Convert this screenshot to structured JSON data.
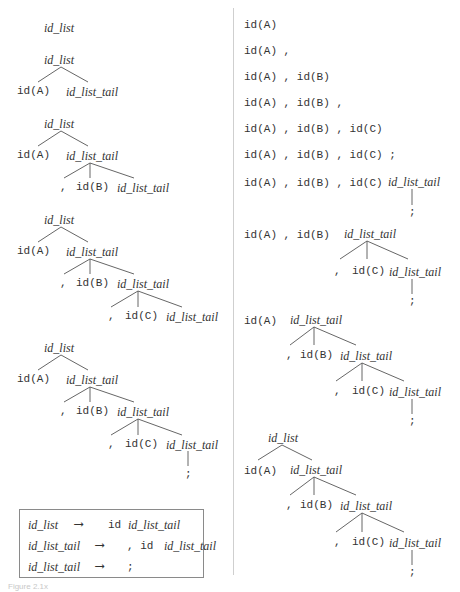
{
  "figure": {
    "caption": "Figure 2.1x",
    "colors": {
      "text": "#333333",
      "edge": "#555555",
      "divider": "#cfcfcf",
      "box_border": "#8a8a8a"
    }
  },
  "symbols": {
    "id_list": "id_list",
    "id_list_tail": "id_list_tail",
    "idA": "id(A)",
    "idB": "id(B)",
    "idC": "id(C)",
    "comma": ",",
    "semicolon": ";"
  },
  "grammar": {
    "rules": [
      {
        "lhs": "id_list",
        "arrow": "⟶",
        "rhs_terms": "id",
        "rhs_nonterm": "id_list_tail"
      },
      {
        "lhs": "id_list_tail",
        "arrow": "⟶",
        "rhs_terms": ", id",
        "rhs_nonterm": "id_list_tail"
      },
      {
        "lhs": "id_list_tail",
        "arrow": "⟶",
        "rhs_terms": ";",
        "rhs_nonterm": ""
      }
    ]
  },
  "top_down_steps": [
    {
      "step": 1,
      "root": "id_list"
    },
    {
      "step": 2,
      "root": "id_list",
      "expanded": [
        "id(A)",
        "id_list_tail"
      ]
    },
    {
      "step": 3,
      "root": "id_list",
      "expanded": [
        "id(A)",
        ",",
        "id(B)",
        "id_list_tail"
      ]
    },
    {
      "step": 4,
      "root": "id_list",
      "expanded": [
        "id(A)",
        ",",
        "id(B)",
        ",",
        "id(C)",
        "id_list_tail"
      ]
    },
    {
      "step": 5,
      "root": "id_list",
      "expanded": [
        "id(A)",
        ",",
        "id(B)",
        ",",
        "id(C)",
        ";"
      ]
    }
  ],
  "bottom_up_rows": [
    {
      "row": 1,
      "forest": "id(A)"
    },
    {
      "row": 2,
      "forest": "id(A) ,"
    },
    {
      "row": 3,
      "forest": "id(A) , id(B)"
    },
    {
      "row": 4,
      "forest": "id(A) , id(B) ,"
    },
    {
      "row": 5,
      "forest": "id(A) , id(B) , id(C)"
    },
    {
      "row": 6,
      "forest": "id(A) , id(B) , id(C) ;"
    },
    {
      "row": 7,
      "forest": "id(A) , id(B) , id(C)",
      "tree_root": "id_list_tail"
    },
    {
      "row": 8,
      "forest": "id(A) , id(B)",
      "tree_root": "id_list_tail"
    },
    {
      "row": 9,
      "forest": "id(A)",
      "tree_root": "id_list_tail"
    },
    {
      "row": 10,
      "forest": "",
      "tree_root": "id_list"
    }
  ],
  "right_rows_text": {
    "r1": "id(A)",
    "r2": "id(A) ,",
    "r3": "id(A) , id(B)",
    "r4": "id(A) , id(B) ,",
    "r5": "id(A) , id(B) , id(C)",
    "r6": "id(A) , id(B) , id(C) ;",
    "r7": "id(A) , id(B) , id(C)",
    "r8": "id(A) , id(B)"
  }
}
